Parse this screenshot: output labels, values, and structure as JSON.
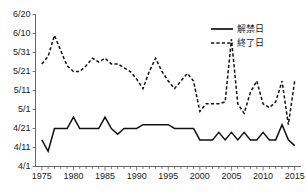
{
  "chart_data": {
    "type": "line",
    "title": "",
    "xlabel": "(年)",
    "ylabel": "",
    "grid": false,
    "legend_position": "top-right",
    "x": [
      1975,
      1976,
      1977,
      1978,
      1979,
      1980,
      1981,
      1982,
      1983,
      1984,
      1985,
      1986,
      1987,
      1988,
      1989,
      1990,
      1991,
      1992,
      1993,
      1994,
      1995,
      1996,
      1997,
      1998,
      1999,
      2000,
      2001,
      2002,
      2003,
      2004,
      2005,
      2006,
      2007,
      2008,
      2009,
      2010,
      2011,
      2012,
      2013,
      2014,
      2015
    ],
    "xlim": [
      1974,
      2016
    ],
    "xticks": [
      1975,
      1980,
      1985,
      1990,
      1995,
      2000,
      2005,
      2010,
      2015
    ],
    "xtick_labels": [
      "1975",
      "1980",
      "1985",
      "1990",
      "1995",
      "2000",
      "2005",
      "2010",
      "2015"
    ],
    "yticks": [
      0,
      10,
      20,
      30,
      40,
      50,
      60,
      70,
      80
    ],
    "ytick_labels": [
      "4/1",
      "4/11",
      "4/21",
      "5/1",
      "5/11",
      "5/21",
      "5/31",
      "6/10",
      "6/20"
    ],
    "ylim": [
      0,
      80
    ],
    "y_unit": "days since 4/1",
    "series": [
      {
        "name": "解禁日",
        "style": "solid",
        "values": [
          14,
          8,
          20,
          20,
          20,
          26,
          20,
          20,
          20,
          20,
          26,
          20,
          17,
          20,
          20,
          20,
          22,
          22,
          22,
          22,
          22,
          20,
          20,
          20,
          20,
          14,
          14,
          14,
          18,
          14,
          18,
          14,
          18,
          14,
          14,
          18,
          14,
          14,
          22,
          14,
          11
        ]
      },
      {
        "name": "終了日",
        "style": "dashed",
        "values": [
          54,
          58,
          69,
          61,
          53,
          50,
          50,
          53,
          57,
          55,
          57,
          54,
          54,
          52,
          50,
          46,
          41,
          50,
          57,
          50,
          45,
          41,
          45,
          49,
          45,
          29,
          33,
          33,
          33,
          34,
          67,
          33,
          28,
          39,
          45,
          33,
          31,
          34,
          45,
          22,
          45
        ]
      }
    ],
    "legend": [
      {
        "label": "解禁日",
        "style": "solid"
      },
      {
        "label": "終了日",
        "style": "dashed"
      }
    ]
  },
  "axes": {
    "x_unit_label": "(年)"
  }
}
